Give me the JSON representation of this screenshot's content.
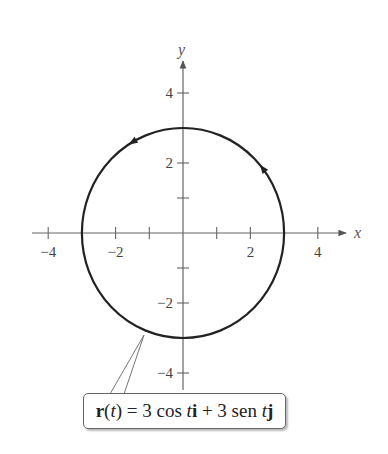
{
  "chart_data": {
    "type": "line",
    "title": "",
    "xlabel": "x",
    "ylabel": "y",
    "xlim": [
      -4.5,
      4.8
    ],
    "ylim": [
      -4.5,
      4.8
    ],
    "x_ticks": [
      -4,
      -3,
      -2,
      -1,
      1,
      2,
      3,
      4
    ],
    "x_tick_labels": {
      "-4": "−4",
      "-2": "−2",
      "2": "2",
      "4": "4"
    },
    "y_ticks": [
      -4,
      -3,
      -2,
      -1,
      1,
      2,
      3,
      4
    ],
    "y_tick_labels": {
      "4": "4",
      "2": "2",
      "-2": "−2",
      "-4": "−4"
    },
    "grid": false,
    "series": [
      {
        "name": "r(t) = 3 cos t i + 3 sen t j",
        "kind": "parametric-circle",
        "center": [
          0,
          0
        ],
        "radius": 3,
        "orientation": "counterclockwise",
        "direction_arrows": [
          {
            "angle_deg": 120
          },
          {
            "angle_deg": 38
          }
        ]
      }
    ],
    "annotation": {
      "text": "r(t) = 3 cos t i + 3 sen t j",
      "points_to_angle_deg": 235
    }
  },
  "labels": {
    "x_axis": "x",
    "y_axis": "y",
    "callout_parts": [
      "r",
      "(",
      "t",
      ") = 3 cos ",
      "t",
      "i",
      " + 3 sen ",
      "t",
      "j"
    ]
  }
}
